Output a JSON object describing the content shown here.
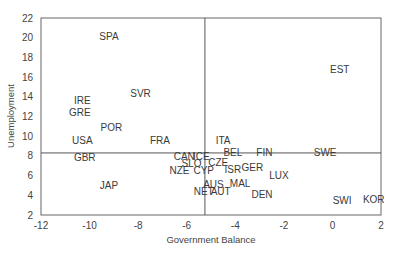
{
  "chart_data": {
    "type": "scatter",
    "title": "",
    "xlabel": "Government Balance",
    "ylabel": "Unemployment",
    "xlim": [
      -12,
      2
    ],
    "ylim": [
      2,
      22
    ],
    "xticks": [
      -12,
      -10,
      -8,
      -6,
      -4,
      -2,
      0,
      2
    ],
    "yticks": [
      2,
      4,
      6,
      8,
      10,
      12,
      14,
      16,
      18,
      20,
      22
    ],
    "grid": false,
    "legend": null,
    "markers": "text labels only",
    "reference_lines": {
      "vertical_x": -5.25,
      "horizontal_y": 8.3
    },
    "points": [
      {
        "label": "SPA",
        "x": -9.2,
        "y": 20.1
      },
      {
        "label": "EST",
        "x": 0.3,
        "y": 16.8
      },
      {
        "label": "SVR",
        "x": -7.9,
        "y": 14.3
      },
      {
        "label": "IRE",
        "x": -10.3,
        "y": 13.6
      },
      {
        "label": "GRE",
        "x": -10.4,
        "y": 12.4
      },
      {
        "label": "POR",
        "x": -9.1,
        "y": 10.9
      },
      {
        "label": "USA",
        "x": -10.3,
        "y": 9.6
      },
      {
        "label": "FRA",
        "x": -7.1,
        "y": 9.6
      },
      {
        "label": "ITA",
        "x": -4.5,
        "y": 9.6
      },
      {
        "label": "GBR",
        "x": -10.2,
        "y": 7.8
      },
      {
        "label": "CAN",
        "x": -6.1,
        "y": 7.9
      },
      {
        "label": "ICE",
        "x": -5.4,
        "y": 7.9
      },
      {
        "label": "BEL",
        "x": -4.1,
        "y": 8.3
      },
      {
        "label": "FIN",
        "x": -2.8,
        "y": 8.3
      },
      {
        "label": "SWE",
        "x": -0.3,
        "y": 8.3
      },
      {
        "label": "SLO",
        "x": -5.8,
        "y": 7.2
      },
      {
        "label": "CZE",
        "x": -4.7,
        "y": 7.3
      },
      {
        "label": "NZE",
        "x": -6.3,
        "y": 6.5
      },
      {
        "label": "CYP",
        "x": -5.3,
        "y": 6.5
      },
      {
        "label": "ISR",
        "x": -4.1,
        "y": 6.6
      },
      {
        "label": "GER",
        "x": -3.3,
        "y": 6.8
      },
      {
        "label": "LUX",
        "x": -2.2,
        "y": 6.0
      },
      {
        "label": "JAP",
        "x": -9.2,
        "y": 5.0
      },
      {
        "label": "AUS",
        "x": -4.9,
        "y": 5.1
      },
      {
        "label": "MAL",
        "x": -3.8,
        "y": 5.2
      },
      {
        "label": "NET",
        "x": -5.3,
        "y": 4.4
      },
      {
        "label": "AUT",
        "x": -4.6,
        "y": 4.4
      },
      {
        "label": "DEN",
        "x": -2.9,
        "y": 4.1
      },
      {
        "label": "SWI",
        "x": 0.4,
        "y": 3.5
      },
      {
        "label": "KOR",
        "x": 1.7,
        "y": 3.6
      }
    ]
  },
  "colors": {
    "axis": "#555555",
    "reference_line": "#555555",
    "text": "#3a3a3a",
    "background": "#ffffff"
  }
}
